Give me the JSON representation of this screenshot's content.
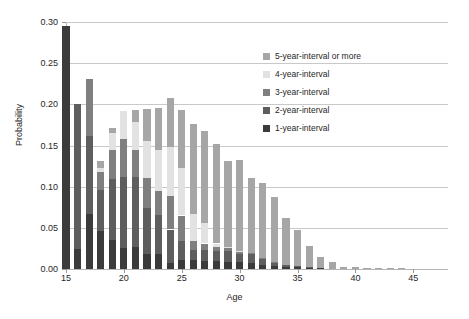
{
  "chart_data": {
    "type": "bar",
    "stacked": true,
    "title": "",
    "xlabel": "Age",
    "ylabel": "Probability",
    "xlim": [
      15,
      48
    ],
    "ylim": [
      0.0,
      0.3
    ],
    "ytick_labels": [
      "0.00",
      "0.05",
      "0.10",
      "0.15",
      "0.20",
      "0.25",
      "0.30"
    ],
    "ytick_values": [
      0.0,
      0.05,
      0.1,
      0.15,
      0.2,
      0.25,
      0.3
    ],
    "xtick_labels": [
      "15",
      "20",
      "25",
      "30",
      "35",
      "40",
      "45"
    ],
    "xtick_values": [
      15,
      20,
      25,
      30,
      35,
      40,
      45
    ],
    "grid": "horizontal",
    "legend_position": "upper-right-inside",
    "categories": [
      15,
      16,
      17,
      18,
      19,
      20,
      21,
      22,
      23,
      24,
      25,
      26,
      27,
      28,
      29,
      30,
      31,
      32,
      33,
      34,
      35,
      36,
      37,
      38,
      39,
      40,
      41,
      42,
      43,
      44,
      45,
      46
    ],
    "series": [
      {
        "name": "1-year-interval",
        "color": "#3b3b3b",
        "values": [
          0.295,
          0.024,
          0.067,
          0.046,
          0.035,
          0.026,
          0.027,
          0.018,
          0.018,
          0.007,
          0.011,
          0.011,
          0.01,
          0.01,
          0.009,
          0.008,
          0.007,
          0.005,
          0.004,
          0.003,
          0.002,
          0.001,
          0.001,
          0.0,
          0.0,
          0.0,
          0.0,
          0.0,
          0.0,
          0.0,
          0.0,
          0.0
        ]
      },
      {
        "name": "2-year-interval",
        "color": "#5e5e5e",
        "values": [
          0.0,
          0.177,
          0.095,
          0.05,
          0.074,
          0.086,
          0.085,
          0.056,
          0.048,
          0.041,
          0.023,
          0.012,
          0.013,
          0.012,
          0.013,
          0.01,
          0.011,
          0.007,
          0.004,
          0.002,
          0.002,
          0.001,
          0.0,
          0.0,
          0.0,
          0.0,
          0.0,
          0.0,
          0.0,
          0.0,
          0.0,
          0.0
        ]
      },
      {
        "name": "3-year-interval",
        "color": "#7f7f7f",
        "values": [
          0.0,
          0.0,
          0.069,
          0.022,
          0.036,
          0.046,
          0.033,
          0.036,
          0.029,
          0.041,
          0.031,
          0.011,
          0.008,
          0.005,
          0.004,
          0.003,
          0.002,
          0.001,
          0.001,
          0.0,
          0.0,
          0.0,
          0.0,
          0.0,
          0.0,
          0.0,
          0.0,
          0.0,
          0.0,
          0.0,
          0.0,
          0.0
        ]
      },
      {
        "name": "4-year-interval",
        "color": "#e2e2e2",
        "values": [
          0.0,
          0.0,
          0.0,
          0.005,
          0.02,
          0.034,
          0.033,
          0.046,
          0.05,
          0.059,
          0.058,
          0.033,
          0.025,
          0.004,
          0.001,
          0.001,
          0.0,
          0.0,
          0.0,
          0.0,
          0.0,
          0.0,
          0.0,
          0.0,
          0.0,
          0.0,
          0.0,
          0.0,
          0.0,
          0.0,
          0.0,
          0.0
        ]
      },
      {
        "name": "5-year-interval or more",
        "color": "#a6a6a6",
        "values": [
          0.0,
          0.0,
          0.0,
          0.008,
          0.006,
          0.0,
          0.015,
          0.038,
          0.05,
          0.06,
          0.07,
          0.109,
          0.112,
          0.121,
          0.104,
          0.111,
          0.09,
          0.091,
          0.078,
          0.057,
          0.044,
          0.026,
          0.014,
          0.008,
          0.003,
          0.002,
          0.001,
          0.001,
          0.001,
          0.001,
          0.0,
          0.0
        ]
      }
    ],
    "legend_entries": [
      "5-year-interval or more",
      "4-year-interval",
      "3-year-interval",
      "2-year-interval",
      "1-year-interval"
    ]
  }
}
